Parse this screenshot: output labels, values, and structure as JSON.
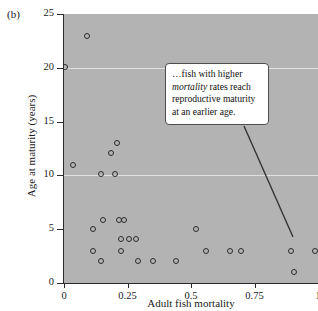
{
  "panel": {
    "label": "(b)"
  },
  "callout": {
    "text_before": "…fish with higher ",
    "emphasis": "mortality",
    "text_after": " rates reach reproductive maturity at an earlier age."
  },
  "chart_data": {
    "type": "scatter",
    "title": "",
    "xlabel": "Adult fish mortality",
    "ylabel": "Age at maturity (years)",
    "xlim": [
      0,
      1.0
    ],
    "ylim": [
      0,
      25
    ],
    "xticks": [
      0,
      0.25,
      0.5,
      0.75,
      1
    ],
    "xticklabels": [
      "0",
      "0.25",
      "0.5",
      "0.75",
      "1"
    ],
    "yticks": [
      0,
      5,
      10,
      15,
      20,
      25
    ],
    "yticklabels": [
      "0",
      "5",
      "10",
      "15",
      "20",
      "25"
    ],
    "grid": "horizontal-light-at-10-and-20",
    "gridlines_y": [
      10,
      20
    ],
    "plot_background": "#b3b3b3",
    "marker": "open-circle",
    "marker_color": "#2b2b2b",
    "legend": "none",
    "annotation": "…fish with higher mortality rates reach reproductive maturity at an earlier age.",
    "points": [
      {
        "x": 0.09,
        "y": 23.0
      },
      {
        "x": 0.005,
        "y": 20.1
      },
      {
        "x": 0.21,
        "y": 13.0
      },
      {
        "x": 0.185,
        "y": 12.1
      },
      {
        "x": 0.035,
        "y": 11.0
      },
      {
        "x": 0.145,
        "y": 10.1
      },
      {
        "x": 0.2,
        "y": 10.1
      },
      {
        "x": 0.155,
        "y": 5.9
      },
      {
        "x": 0.215,
        "y": 5.9
      },
      {
        "x": 0.235,
        "y": 5.9
      },
      {
        "x": 0.115,
        "y": 5.0
      },
      {
        "x": 0.52,
        "y": 5.0
      },
      {
        "x": 0.225,
        "y": 4.1
      },
      {
        "x": 0.255,
        "y": 4.1
      },
      {
        "x": 0.285,
        "y": 4.1
      },
      {
        "x": 0.115,
        "y": 3.0
      },
      {
        "x": 0.225,
        "y": 3.0
      },
      {
        "x": 0.145,
        "y": 2.0
      },
      {
        "x": 0.29,
        "y": 2.0
      },
      {
        "x": 0.35,
        "y": 2.0
      },
      {
        "x": 0.44,
        "y": 2.0
      },
      {
        "x": 0.56,
        "y": 3.0
      },
      {
        "x": 0.655,
        "y": 3.0
      },
      {
        "x": 0.695,
        "y": 3.0
      },
      {
        "x": 0.895,
        "y": 3.0
      },
      {
        "x": 0.99,
        "y": 3.0
      },
      {
        "x": 0.905,
        "y": 1.0
      }
    ]
  }
}
